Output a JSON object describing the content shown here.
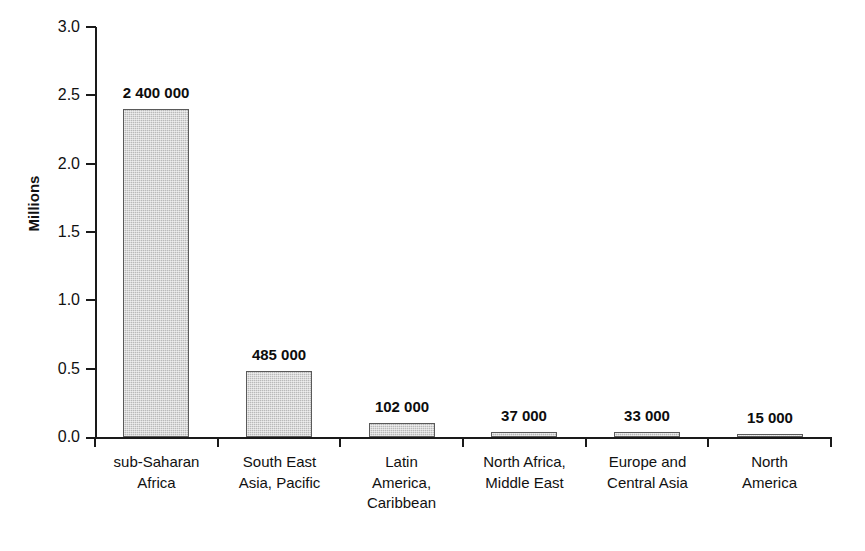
{
  "chart_data": {
    "type": "bar",
    "title": "",
    "subtitle": "",
    "xlabel": "",
    "ylabel": "Millions",
    "ylim": [
      0.0,
      3.0
    ],
    "ytick_labels": [
      "3.0",
      "2.5",
      "2.0",
      "1.5",
      "1.0",
      "0.5",
      "0.0"
    ],
    "ytick_values": [
      3.0,
      2.5,
      2.0,
      1.5,
      1.0,
      0.5,
      0.0
    ],
    "grid": false,
    "legend": null,
    "categories": [
      "sub-Saharan Africa",
      "South East Asia, Pacific",
      "Latin America, Caribbean",
      "North Africa, Middle East",
      "Europe and Central Asia",
      "North America"
    ],
    "category_label_lines": [
      [
        "sub-Saharan",
        "Africa"
      ],
      [
        "South East",
        "Asia, Pacific"
      ],
      [
        "Latin",
        "America,",
        "Caribbean"
      ],
      [
        "North Africa,",
        "Middle East"
      ],
      [
        "Europe and",
        "Central Asia"
      ],
      [
        "North",
        "America"
      ]
    ],
    "values": [
      2.4,
      0.485,
      0.102,
      0.037,
      0.033,
      0.015
    ],
    "data_labels": [
      "2 400 000",
      "485 000",
      "102 000",
      "37 000",
      "33 000",
      "15 000"
    ],
    "bar_fill_color": "#b9b9b9",
    "bar_border_color": "#5a5a5a",
    "axis_color": "#1a1a1a",
    "text_color": "#111111"
  }
}
